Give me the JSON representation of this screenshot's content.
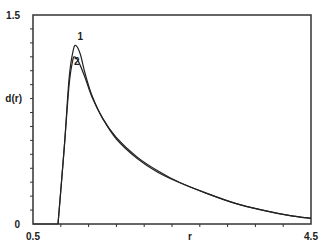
{
  "chart_data": {
    "type": "line",
    "title": "",
    "xlabel": "r",
    "ylabel": "d(r)",
    "xlim": [
      0.5,
      4.5
    ],
    "ylim": [
      0,
      1.5
    ],
    "x_tick_labels": [
      "0.5",
      "4.5"
    ],
    "y_tick_labels": [
      "0",
      "1.5"
    ],
    "grid": false,
    "legend": "inline numeric labels near peak",
    "series": [
      {
        "name": "1",
        "x": [
          0.86,
          0.95,
          1.02,
          1.08,
          1.12,
          1.18,
          1.25,
          1.35,
          1.5,
          1.7,
          2.0,
          2.3,
          2.6,
          3.0,
          3.4,
          3.8,
          4.2,
          4.5
        ],
        "y": [
          0.0,
          0.55,
          1.05,
          1.25,
          1.28,
          1.22,
          1.08,
          0.92,
          0.76,
          0.62,
          0.48,
          0.38,
          0.3,
          0.22,
          0.15,
          0.1,
          0.06,
          0.04
        ]
      },
      {
        "name": "2",
        "x": [
          0.86,
          0.95,
          1.02,
          1.07,
          1.1,
          1.16,
          1.25,
          1.35,
          1.5,
          1.7,
          2.0,
          2.3,
          2.6,
          3.0,
          3.4,
          3.8,
          4.2,
          4.5
        ],
        "y": [
          0.0,
          0.55,
          1.0,
          1.17,
          1.2,
          1.16,
          1.05,
          0.91,
          0.76,
          0.61,
          0.47,
          0.37,
          0.3,
          0.22,
          0.15,
          0.1,
          0.06,
          0.04
        ]
      }
    ],
    "annotations": [
      {
        "text": "1",
        "x": 1.14,
        "y": 1.32
      },
      {
        "text": "2",
        "x": 1.09,
        "y": 1.14
      }
    ]
  }
}
